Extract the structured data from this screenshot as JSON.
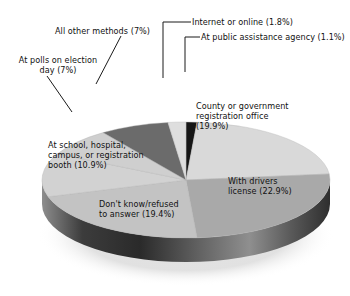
{
  "chart_data": {
    "type": "pie",
    "title": "",
    "xlabel": "",
    "ylabel": "",
    "legend_position": "none",
    "grid": false,
    "three_d": true,
    "categories": [
      "County or government registration office",
      "With drivers license",
      "Don't know/refused to answer",
      "At school, hospital, campus, or registration booth",
      "At polls on election day",
      "All other methods",
      "Internet or online",
      "At public assistance agency"
    ],
    "values": [
      19.9,
      22.9,
      19.4,
      10.9,
      7.0,
      7.0,
      1.8,
      1.1
    ],
    "value_labels": [
      "19.9%",
      "22.9%",
      "19.4%",
      "10.9%",
      "7%",
      "7%",
      "1.8%",
      "1.1%"
    ],
    "colors": [
      "#d9d9d9",
      "#a9a9a9",
      "#c3c3c3",
      "#d2d2d2",
      "#cfcfcf",
      "#6b6b6b",
      "#dedede",
      "#161616"
    ]
  },
  "slices": [
    {
      "name": "county",
      "label": "County or government\nregistration office\n(19.9%)",
      "value": 19.9,
      "color": "#d9d9d9"
    },
    {
      "name": "drivers-license",
      "label": "With drivers\nlicense (22.9%)",
      "value": 22.9,
      "color": "#a9a9a9"
    },
    {
      "name": "dont-know",
      "label": "Don't know/refused\nto answer (19.4%)",
      "value": 19.4,
      "color": "#c3c3c3"
    },
    {
      "name": "school-hospital",
      "label": "At school, hospital,\ncampus, or registration\nbooth (10.9%)",
      "value": 10.9,
      "color": "#d2d2d2"
    },
    {
      "name": "polls-election-day",
      "label": "At polls on election\nday (7%)",
      "value": 7.0,
      "color": "#cfcfcf"
    },
    {
      "name": "all-other-methods",
      "label": "All other methods (7%)",
      "value": 7.0,
      "color": "#6b6b6b"
    },
    {
      "name": "internet-online",
      "label": "Internet or online (1.8%)",
      "value": 1.8,
      "color": "#dedede"
    },
    {
      "name": "public-assistance",
      "label": "At public assistance agency (1.1%)",
      "value": 1.1,
      "color": "#161616"
    }
  ]
}
